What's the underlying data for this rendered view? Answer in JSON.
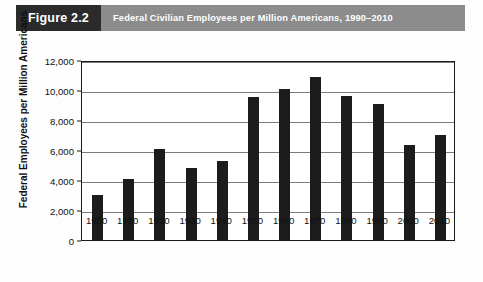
{
  "header": {
    "figure_label": "Figure 2.2",
    "title": "Federal Civilian Employees per Million Americans, 1990–2010",
    "box_color": "#2b2b2b",
    "banner_color": "#8c8c8c",
    "text_color": "#ffffff"
  },
  "chart_data": {
    "type": "bar",
    "title": "Federal Civilian Employees per Million Americans, 1990–2010",
    "xlabel": "",
    "ylabel": "Federal Employees per Million  Americans",
    "categories": [
      "1900",
      "1910",
      "1920",
      "1930",
      "1940",
      "1950",
      "1960",
      "1970",
      "1980",
      "1990",
      "2000",
      "2010"
    ],
    "values": [
      3000,
      4100,
      6100,
      4800,
      5300,
      9550,
      10100,
      10900,
      9600,
      9100,
      6350,
      7000
    ],
    "ylim": [
      0,
      12000
    ],
    "ytick_step": 2000,
    "ytick_labels": [
      "0",
      "2,000",
      "4,000",
      "6,000",
      "8,000",
      "10,000",
      "12,000"
    ],
    "ytick_values": [
      0,
      2000,
      4000,
      6000,
      8000,
      10000,
      12000
    ],
    "grid": true,
    "legend": null,
    "bar_color": "#1c1c1c",
    "grid_color": "#7d7d7d",
    "axis_color": "#1a1a1a"
  }
}
